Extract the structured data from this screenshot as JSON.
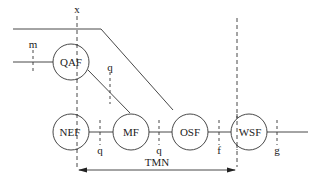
{
  "diagram": {
    "nodes": [
      {
        "id": "QAF",
        "label": "QAF"
      },
      {
        "id": "NEF",
        "label": "NEF"
      },
      {
        "id": "MF",
        "label": "MF"
      },
      {
        "id": "OSF",
        "label": "OSF"
      },
      {
        "id": "WSF",
        "label": "WSF"
      }
    ],
    "reference_points": {
      "x": "x",
      "m": "m",
      "q1": "q",
      "q2": "q",
      "q3": "q",
      "f": "f",
      "g": "g"
    },
    "boundary_label": "TMN"
  }
}
